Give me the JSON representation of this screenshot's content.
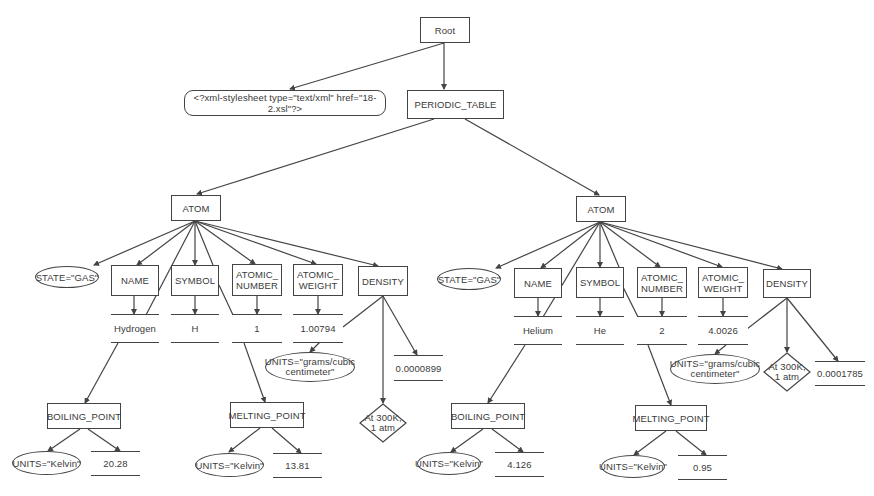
{
  "diagram": {
    "root": {
      "label": "Root"
    },
    "stylesheet_pi": {
      "label": "<?xml-stylesheet type=\"text/xml\" href=\"18-2.xsl\"?>"
    },
    "periodic_table": {
      "label": "PERIODIC_TABLE"
    },
    "atoms": [
      {
        "label": "ATOM",
        "state_attr": "STATE=\"GAS\"",
        "name": {
          "label": "NAME",
          "value": "Hydrogen"
        },
        "symbol": {
          "label": "SYMBOL",
          "value": "H"
        },
        "atomic_number": {
          "label_line1": "ATOMIC_",
          "label_line2": "NUMBER",
          "value": "1"
        },
        "atomic_weight": {
          "label_line1": "ATOMIC_",
          "label_line2": "WEIGHT",
          "value": "1.00794"
        },
        "density": {
          "label": "DENSITY",
          "units_attr_line1": "UNITS=\"grams/cubic",
          "units_attr_line2": "centimeter\"",
          "comment_line1": "At 300K,",
          "comment_line2": "1 atm",
          "value": "0.0000899"
        },
        "boiling_point": {
          "label": "BOILING_POINT",
          "units_attr": "UNITS=\"Kelvin\"",
          "value": "20.28"
        },
        "melting_point": {
          "label": "MELTING_POINT",
          "units_attr": "UNITS=\"Kelvin\"",
          "value": "13.81"
        }
      },
      {
        "label": "ATOM",
        "state_attr": "STATE=\"GAS\"",
        "name": {
          "label": "NAME",
          "value": "Helium"
        },
        "symbol": {
          "label": "SYMBOL",
          "value": "He"
        },
        "atomic_number": {
          "label_line1": "ATOMIC_",
          "label_line2": "NUMBER",
          "value": "2"
        },
        "atomic_weight": {
          "label_line1": "ATOMIC_",
          "label_line2": "WEIGHT",
          "value": "4.0026"
        },
        "density": {
          "label": "DENSITY",
          "units_attr_line1": "UNITS=\"grams/cubic",
          "units_attr_line2": "centimeter\"",
          "comment_line1": "At 300K,",
          "comment_line2": "1 atm",
          "value": "0.0001785"
        },
        "boiling_point": {
          "label": "BOILING_POINT",
          "units_attr": "UNITS=\"Kelvin\"",
          "value": "4.126"
        },
        "melting_point": {
          "label": "MELTING_POINT",
          "units_attr": "UNITS=\"Kelvin\"",
          "value": "0.95"
        }
      }
    ],
    "colors": {
      "stroke": "#444444",
      "text": "#3a3a3a",
      "background": "#ffffff"
    }
  }
}
